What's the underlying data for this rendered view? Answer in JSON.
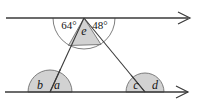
{
  "figure": {
    "background_color": "#ffffff",
    "line_color": "#3a3a3a",
    "shade_fill": "#d2d2d2",
    "shade_stroke": "#6f6f6f",
    "text_color": "#141414",
    "top_line": {
      "name": "upper-parallel-line",
      "arrow": "right-arrowhead",
      "y": 18,
      "x_start": 6,
      "x_end": 190
    },
    "bottom_line": {
      "name": "lower-parallel-line",
      "arrow": "right-arrowhead",
      "y": 92,
      "x_start": 5,
      "x_end": 190
    },
    "apex": {
      "x": 84,
      "y": 18
    },
    "left_vertex": {
      "x": 50,
      "y": 92
    },
    "right_vertex": {
      "x": 145,
      "y": 92
    },
    "labels": {
      "angle_left_deg": "64°",
      "angle_right_deg": "48°",
      "angle_apex": "e",
      "angle_bottom_left_outer": "b",
      "angle_bottom_left_inner": "a",
      "angle_bottom_right_inner": "c",
      "angle_bottom_right_outer": "d"
    },
    "arcs": {
      "apex_radius": 31,
      "left_radius": 22,
      "right_radius": 19
    }
  }
}
